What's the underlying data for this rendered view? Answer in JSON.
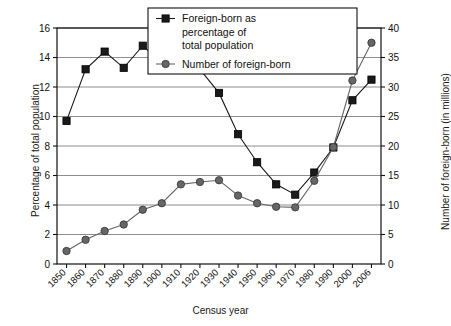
{
  "chart_data": {
    "type": "line",
    "title": "",
    "xlabel": "Census year",
    "ylabel": "Percentage of total population",
    "ylabel_right": "Number of foreign-born (in millions)",
    "categories": [
      "1850",
      "1860",
      "1870",
      "1880",
      "1890",
      "1900",
      "1910",
      "1920",
      "1930",
      "1940",
      "1950",
      "1960",
      "1970",
      "1980",
      "1990",
      "2000",
      "2006"
    ],
    "ylim": [
      0,
      16
    ],
    "yticks": [
      0,
      2,
      4,
      6,
      8,
      10,
      12,
      14,
      16
    ],
    "ylim_right": [
      0,
      40
    ],
    "yticks_right": [
      0,
      5,
      10,
      15,
      20,
      25,
      30,
      35,
      40
    ],
    "grid": true,
    "legend_position": "top-center",
    "series": [
      {
        "name": "Foreign-born as percentage of total population",
        "axis": "left",
        "marker": "square",
        "color": "#1a1a1a",
        "values": [
          9.7,
          13.2,
          14.4,
          13.3,
          14.8,
          13.6,
          14.7,
          13.2,
          11.6,
          8.8,
          6.9,
          5.4,
          4.7,
          6.2,
          7.9,
          11.1,
          12.5
        ]
      },
      {
        "name": "Number of foreign-born",
        "axis": "right",
        "marker": "circle",
        "color": "#666666",
        "values": [
          2.2,
          4.1,
          5.6,
          6.7,
          9.2,
          10.3,
          13.5,
          13.9,
          14.2,
          11.6,
          10.3,
          9.7,
          9.6,
          14.1,
          19.8,
          31.1,
          37.5
        ]
      }
    ],
    "legend_entries": [
      {
        "marker": "square",
        "color": "#1a1a1a",
        "lines": [
          "Foreign-born as",
          "percentage of",
          "total population"
        ]
      },
      {
        "marker": "circle",
        "color": "#666666",
        "lines": [
          "Number of foreign-born"
        ]
      }
    ]
  }
}
